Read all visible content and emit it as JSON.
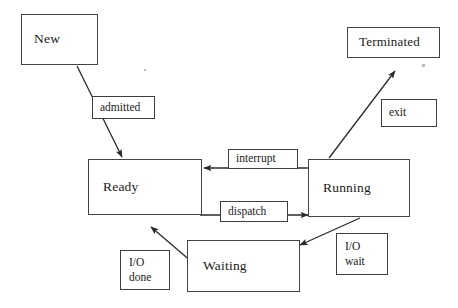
{
  "diagram": {
    "background_color": "#ffffff",
    "stroke_color": "#3a3a3a",
    "text_color": "#1a1a1a"
  },
  "states": [
    {
      "id": "new",
      "label": "New"
    },
    {
      "id": "ready",
      "label": "Ready"
    },
    {
      "id": "running",
      "label": "Running"
    },
    {
      "id": "terminated",
      "label": "Terminated"
    },
    {
      "id": "waiting",
      "label": "Waiting"
    }
  ],
  "transitions": [
    {
      "id": "admitted",
      "label": "admitted",
      "from": "New",
      "to": "Ready"
    },
    {
      "id": "exit",
      "label": "exit",
      "from": "Running",
      "to": "Terminated"
    },
    {
      "id": "interrupt",
      "label": "interrupt",
      "from": "Running",
      "to": "Ready"
    },
    {
      "id": "dispatch",
      "label": "dispatch",
      "from": "Ready",
      "to": "Running"
    },
    {
      "id": "io_wait",
      "label": "I/O\nwait",
      "from": "Running",
      "to": "Waiting"
    },
    {
      "id": "io_done",
      "label": "I/O\ndone",
      "from": "Waiting",
      "to": "Ready"
    }
  ]
}
